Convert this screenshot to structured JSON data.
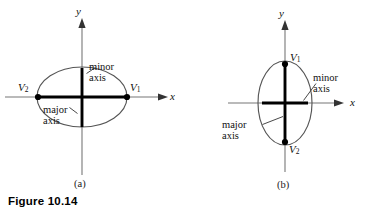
{
  "figure": {
    "caption": "Figure 10.14",
    "background_color": "#ffffff",
    "ink_color": "#000000",
    "curve_color": "#555555",
    "axis_color": "#777777"
  },
  "panels": [
    {
      "id": "a",
      "sublabel": "(a)",
      "orientation": "horizontal-major",
      "axis_labels": {
        "x": "x",
        "y": "y"
      },
      "vertices": [
        {
          "name": "V2",
          "label": "V",
          "subscript": "2",
          "position": "left"
        },
        {
          "name": "V1",
          "label": "V",
          "subscript": "1",
          "position": "right"
        }
      ],
      "annotations": [
        {
          "name": "minor-axis",
          "line1": "minor",
          "line2": "axis"
        },
        {
          "name": "major-axis",
          "line1": "major",
          "line2": "axis"
        }
      ]
    },
    {
      "id": "b",
      "sublabel": "(b)",
      "orientation": "vertical-major",
      "axis_labels": {
        "x": "x",
        "y": "y"
      },
      "vertices": [
        {
          "name": "V1",
          "label": "V",
          "subscript": "1",
          "position": "top"
        },
        {
          "name": "V2",
          "label": "V",
          "subscript": "2",
          "position": "bottom"
        }
      ],
      "annotations": [
        {
          "name": "minor-axis",
          "line1": "minor",
          "line2": "axis"
        },
        {
          "name": "major-axis",
          "line1": "major",
          "line2": "axis"
        }
      ]
    }
  ]
}
